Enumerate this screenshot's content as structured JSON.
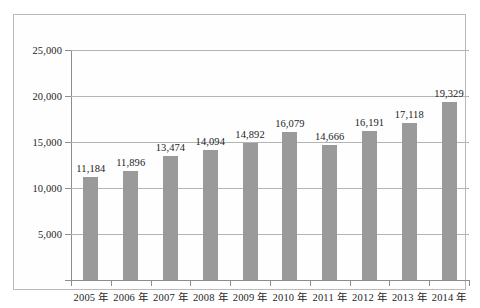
{
  "chart_data": {
    "type": "bar",
    "title": "",
    "subtitle": "",
    "xlabel": "",
    "ylabel": "",
    "categories": [
      "2005 年",
      "2006 年",
      "2007 年",
      "2008 年",
      "2009 年",
      "2010 年",
      "2011 年",
      "2012 年",
      "2013 年",
      "2014 年"
    ],
    "values": [
      11184,
      11896,
      13474,
      14094,
      14892,
      16079,
      14666,
      16191,
      17118,
      19329
    ],
    "value_labels": [
      "11,184",
      "11,896",
      "13,474",
      "14,094",
      "14,892",
      "16,079",
      "14,666",
      "16,191",
      "17,118",
      "19,329"
    ],
    "ylim": [
      0,
      25000
    ],
    "ytick_values": [
      0,
      5000,
      10000,
      15000,
      20000,
      25000
    ],
    "ytick_labels": [
      "",
      "5,000",
      "10,000",
      "15,000",
      "20,000",
      "25,000"
    ],
    "grid": true,
    "legend": "none",
    "series": [
      {
        "name": "",
        "color": "#9a9a9a",
        "values": [
          11184,
          11896,
          13474,
          14094,
          14892,
          16079,
          14666,
          16191,
          17118,
          19329
        ]
      }
    ],
    "colors": {
      "bar": "#9a9a9a",
      "gridline": "#b4b4b4",
      "axis": "#8d8d8d",
      "frame": "#b9b9b9",
      "text": "#1d1d1d",
      "background": "#ffffff"
    }
  }
}
